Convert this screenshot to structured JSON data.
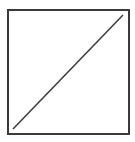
{
  "diagram": {
    "type": "square-with-diagonal",
    "background": "#ffffff",
    "stroke_color": "#3a3a3a",
    "square": {
      "x": 8,
      "y": 10,
      "width": 121,
      "height": 124,
      "stroke_width": 2
    },
    "diagonal": {
      "x1": 13,
      "y1": 129,
      "x2": 123,
      "y2": 15,
      "stroke_width": 1.5
    }
  }
}
